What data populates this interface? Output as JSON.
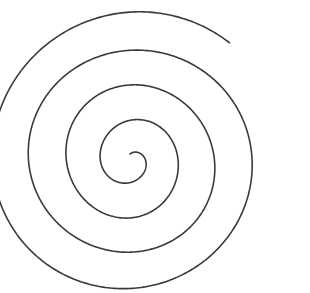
{
  "image": {
    "kind": "line-drawing",
    "subject": "spiral",
    "title": "Spiral",
    "background_color": "#ffffff",
    "width": 310,
    "height": 293
  },
  "drawing": {
    "name": "archimedean-spiral",
    "stroke_color": "#3a3a3a",
    "stroke_width": 1.6,
    "fill": "none",
    "turns": 4,
    "winding": "counterclockwise-outward",
    "center_x": 131,
    "center_y": 160,
    "inner_radius": 6,
    "outer_radius": 152,
    "start_angle_deg": 100,
    "total_sweep_deg": 1490,
    "inner_end_x": 128,
    "inner_end_y": 155,
    "outer_end_x": 282,
    "outer_end_y": 243,
    "bounds": {
      "top_y": 22,
      "bottom_y": 275,
      "left_x": 19,
      "right_x": 294
    },
    "turn_crossings_horizontal_left": [
      20,
      57,
      85,
      110
    ],
    "turn_crossings_horizontal_right": [
      155,
      190,
      228,
      270
    ],
    "turn_crossings_vertical_above": [
      22,
      62,
      100,
      143
    ],
    "turn_crossings_vertical_below": [
      178,
      218,
      250,
      275
    ]
  }
}
